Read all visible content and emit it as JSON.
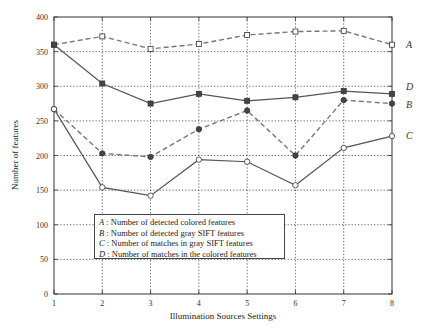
{
  "chart_data": {
    "type": "line",
    "title": "",
    "xlabel": "Illumination Sources Settings",
    "ylabel": "Number of features",
    "x": [
      1,
      2,
      3,
      4,
      5,
      6,
      7,
      8
    ],
    "xlim": [
      1,
      8
    ],
    "ylim": [
      0,
      400
    ],
    "yticks": [
      0,
      50,
      100,
      150,
      200,
      250,
      300,
      350,
      400
    ],
    "xticks": [
      1,
      2,
      3,
      4,
      5,
      6,
      7,
      8
    ],
    "grid": true,
    "legend_position": "lower-left inside",
    "series": [
      {
        "key": "A",
        "name": "Number of detected colored features",
        "style": "dashed",
        "marker": "square-open",
        "values": [
          360,
          372,
          354,
          361,
          374,
          379,
          380,
          360
        ]
      },
      {
        "key": "B",
        "name": "Number of detected gray SIFT features",
        "style": "dashed",
        "marker": "circle-filled",
        "values": [
          267,
          203,
          198,
          238,
          265,
          200,
          280,
          275
        ]
      },
      {
        "key": "C",
        "name": "Number of matches in gray SIFT features",
        "style": "solid",
        "marker": "circle-open",
        "values": [
          267,
          154,
          142,
          194,
          191,
          157,
          211,
          228
        ]
      },
      {
        "key": "D",
        "name": "Number of matches in the colored features",
        "style": "solid",
        "marker": "square-filled",
        "values": [
          360,
          304,
          275,
          289,
          279,
          284,
          293,
          289
        ]
      }
    ]
  },
  "legend": {
    "items": [
      {
        "key": "A",
        "sep": " : ",
        "label": "Number of detected colored features"
      },
      {
        "key": "B",
        "sep": " : ",
        "label": "Number of detected gray SIFT features"
      },
      {
        "key": "C",
        "sep": " : ",
        "label": "Number of matches in gray SIFT features"
      },
      {
        "key": "D",
        "sep": " : ",
        "label": "Number of matches in the colored features"
      }
    ]
  },
  "colors": {
    "axis": "#333333",
    "grid": "#333333",
    "line_A": "#777777",
    "line_B": "#777777",
    "line_C": "#555555",
    "line_D": "#555555"
  }
}
